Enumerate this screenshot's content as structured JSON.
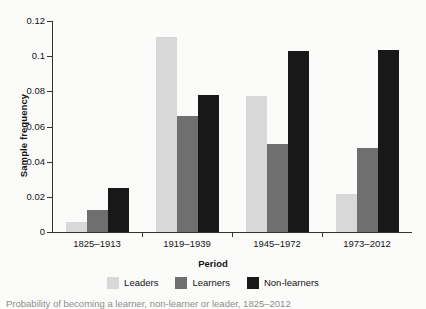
{
  "chart_data": {
    "type": "bar",
    "title": "",
    "xlabel": "Period",
    "ylabel": "Sample frequency",
    "categories": [
      "1825–1913",
      "1919–1939",
      "1945–1972",
      "1973–2012"
    ],
    "series": [
      {
        "name": "Leaders",
        "color": "#d8d8d8",
        "values": [
          0.0055,
          0.111,
          0.0775,
          0.0215
        ]
      },
      {
        "name": "Learners",
        "color": "#6f6f6f",
        "values": [
          0.0128,
          0.0658,
          0.05,
          0.0477
        ]
      },
      {
        "name": "Non-learners",
        "color": "#181818",
        "values": [
          0.0252,
          0.0778,
          0.1032,
          0.1038
        ]
      }
    ],
    "ylim": [
      0,
      0.12
    ],
    "yticks": [
      0,
      0.02,
      0.04,
      0.06,
      0.08,
      0.1,
      0.12
    ],
    "ytick_labels": [
      "0",
      "0.02",
      "0.04",
      "0.06",
      "0.08",
      "0.1",
      "0.12"
    ],
    "grid": false,
    "legend_position": "bottom"
  },
  "caption": {
    "text": "Probability of becoming a learner, non-learner or leader, 1825–2012"
  }
}
